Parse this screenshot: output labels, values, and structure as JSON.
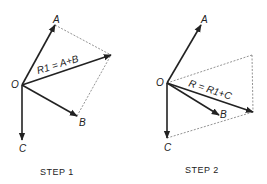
{
  "step1": {
    "caption": "STEP 1",
    "labels": {
      "origin": "O",
      "a": "A",
      "b": "B",
      "c": "C",
      "resultant": "R1 = A+B"
    }
  },
  "step2": {
    "caption": "STEP 2",
    "labels": {
      "origin": "O",
      "a": "A",
      "b": "B",
      "c": "C",
      "resultant": "R = R1+C"
    }
  },
  "colors": {
    "line": "#222222",
    "dashed": "#666666"
  }
}
